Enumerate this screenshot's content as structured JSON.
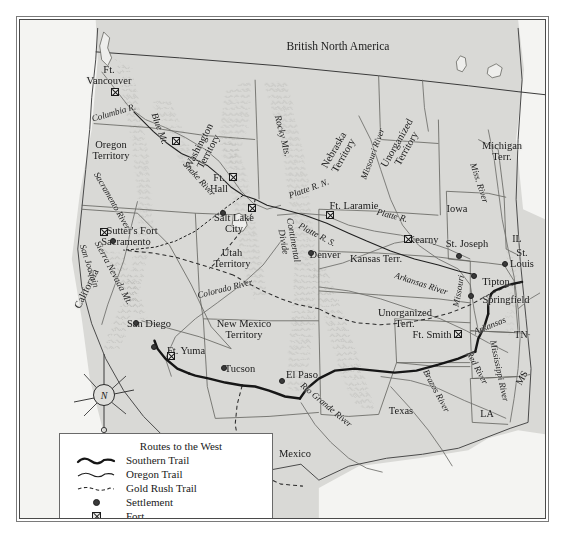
{
  "figure": {
    "kind": "historical-map",
    "frame_color": "#4a4a4a",
    "land_color": "#d9d9d6",
    "water_color": "#f2f2f0",
    "ink_color": "#1a1a1a"
  },
  "legend": {
    "title": "Routes to the West",
    "rows": [
      {
        "key": "thick-wavy-line",
        "label": "Southern Trail"
      },
      {
        "key": "thin-wavy-line",
        "label": "Oregon Trail"
      },
      {
        "key": "dashed-line",
        "label": "Gold Rush Trail"
      },
      {
        "key": "filled-dot",
        "label": "Settlement"
      },
      {
        "key": "crossed-square",
        "label": "Fort"
      }
    ]
  },
  "compass": {
    "north_letter": "N"
  },
  "labels": {
    "regions": [
      {
        "text": "British North America",
        "x": 337,
        "y": 46,
        "style": "t-big"
      },
      {
        "text": "Oregon\nTerritory",
        "x": 110,
        "y": 150,
        "style": "t-region"
      },
      {
        "text": "Washington\nTerritory",
        "x": 203,
        "y": 148,
        "style": "t-region",
        "rot": -62
      },
      {
        "text": "Utah\nTerritory",
        "x": 231,
        "y": 258,
        "style": "t-region"
      },
      {
        "text": "New Mexico\nTerritory",
        "x": 243,
        "y": 329,
        "style": "t-region"
      },
      {
        "text": "Nebraska\nTerritory",
        "x": 338,
        "y": 152,
        "style": "t-region",
        "rot": -60
      },
      {
        "text": "Unorganized\nTerritory",
        "x": 401,
        "y": 145,
        "style": "t-region",
        "rot": -60
      },
      {
        "text": "Kansas Terr.",
        "x": 375,
        "y": 258,
        "style": "t-region"
      },
      {
        "text": "Unorganized\nTerr.",
        "x": 404,
        "y": 318,
        "style": "t-region"
      },
      {
        "text": "Michigan\nTerr.",
        "x": 501,
        "y": 151,
        "style": "t-region"
      },
      {
        "text": "Iowa",
        "x": 456,
        "y": 208,
        "style": "t-region"
      },
      {
        "text": "Texas",
        "x": 400,
        "y": 410,
        "style": "t-region"
      },
      {
        "text": "California",
        "x": 86,
        "y": 288,
        "style": "t-region",
        "rot": -64
      },
      {
        "text": "Mexico",
        "x": 294,
        "y": 453,
        "style": "t-region"
      }
    ],
    "states": [
      {
        "text": "IL",
        "x": 516,
        "y": 238,
        "style": "t-state"
      },
      {
        "text": "TN",
        "x": 520,
        "y": 334,
        "style": "t-state"
      },
      {
        "text": "MS",
        "x": 521,
        "y": 377,
        "style": "t-state",
        "rot": -60
      },
      {
        "text": "LA",
        "x": 486,
        "y": 413,
        "style": "t-state"
      }
    ],
    "cities": [
      {
        "text": "Ft.\nVancouver",
        "x": 108,
        "y": 75,
        "style": "t-city"
      },
      {
        "text": "Ft.\nHall",
        "x": 218,
        "y": 183,
        "style": "t-city"
      },
      {
        "text": "Salt Lake\nCity",
        "x": 233,
        "y": 223,
        "style": "t-city"
      },
      {
        "text": "Sutter's Fort",
        "x": 131,
        "y": 230,
        "style": "t-city"
      },
      {
        "text": "Sacramento",
        "x": 125,
        "y": 241,
        "style": "t-city"
      },
      {
        "text": "Ft. Laramie",
        "x": 353,
        "y": 205,
        "style": "t-city"
      },
      {
        "text": "Denver",
        "x": 324,
        "y": 254,
        "style": "t-city"
      },
      {
        "text": "Kearny",
        "x": 422,
        "y": 239,
        "style": "t-city"
      },
      {
        "text": "St. Joseph",
        "x": 466,
        "y": 243,
        "style": "t-city"
      },
      {
        "text": "St.\nLouis",
        "x": 521,
        "y": 258,
        "style": "t-city"
      },
      {
        "text": "Tipton",
        "x": 495,
        "y": 281,
        "style": "t-city"
      },
      {
        "text": "Springfield",
        "x": 505,
        "y": 299,
        "style": "t-city"
      },
      {
        "text": "Ft. Smith",
        "x": 431,
        "y": 334,
        "style": "t-city"
      },
      {
        "text": "San Diego",
        "x": 148,
        "y": 323,
        "style": "t-city"
      },
      {
        "text": "Ft. Yuma",
        "x": 185,
        "y": 350,
        "style": "t-city"
      },
      {
        "text": "Tucson",
        "x": 239,
        "y": 368,
        "style": "t-city"
      },
      {
        "text": "El Paso",
        "x": 301,
        "y": 374,
        "style": "t-city"
      }
    ],
    "rivers": [
      {
        "text": "Columbia R.",
        "x": 113,
        "y": 112,
        "style": "t-river",
        "rot": -16
      },
      {
        "text": "Snake River",
        "x": 198,
        "y": 178,
        "style": "t-river",
        "rot": 48
      },
      {
        "text": "Sacramento River",
        "x": 111,
        "y": 200,
        "style": "t-river",
        "rot": 60
      },
      {
        "text": "San Joaquin",
        "x": 88,
        "y": 265,
        "style": "t-river",
        "rot": 72
      },
      {
        "text": "Colorado River",
        "x": 224,
        "y": 288,
        "style": "t-river",
        "rot": -14
      },
      {
        "text": "Platte R. N.",
        "x": 308,
        "y": 188,
        "style": "t-river",
        "rot": -20
      },
      {
        "text": "Platte R.",
        "x": 391,
        "y": 215,
        "style": "t-river",
        "rot": 14
      },
      {
        "text": "Platte R. S.",
        "x": 316,
        "y": 234,
        "style": "t-river",
        "rot": 28
      },
      {
        "text": "Missouri River",
        "x": 372,
        "y": 153,
        "style": "t-river",
        "rot": -70
      },
      {
        "text": "Arkansas River",
        "x": 420,
        "y": 283,
        "style": "t-river",
        "rot": 18
      },
      {
        "text": "Missouri",
        "x": 458,
        "y": 290,
        "style": "t-river",
        "rot": -80
      },
      {
        "text": "Miss. River",
        "x": 478,
        "y": 182,
        "style": "t-river",
        "rot": 72
      },
      {
        "text": "Mississippi River",
        "x": 498,
        "y": 370,
        "style": "t-river",
        "rot": 78
      },
      {
        "text": "Arkansas",
        "x": 489,
        "y": 325,
        "style": "t-river",
        "rot": -22
      },
      {
        "text": "Red River",
        "x": 476,
        "y": 367,
        "style": "t-river",
        "rot": 62
      },
      {
        "text": "Brazos River",
        "x": 435,
        "y": 390,
        "style": "t-river",
        "rot": 62
      },
      {
        "text": "Rio Grande River",
        "x": 325,
        "y": 404,
        "style": "t-river",
        "rot": 40
      }
    ],
    "mountains": [
      {
        "text": "Rocky Mts.",
        "x": 281,
        "y": 135,
        "style": "t-mtn",
        "rot": 76
      },
      {
        "text": "Blue Mt.",
        "x": 158,
        "y": 128,
        "style": "t-mtn",
        "rot": 70
      },
      {
        "text": "Sierra Nevada Mt.",
        "x": 112,
        "y": 272,
        "style": "t-mtn",
        "rot": 62
      },
      {
        "text": "Continental\nDivide",
        "x": 287,
        "y": 240,
        "style": "t-mtn",
        "rot": 80
      }
    ]
  },
  "symbols": {
    "settlements": [
      {
        "name": "sacramento",
        "x": 112,
        "y": 240
      },
      {
        "name": "san-diego",
        "x": 135,
        "y": 322
      },
      {
        "name": "unnamed-baja",
        "x": 153,
        "y": 346
      },
      {
        "name": "tucson",
        "x": 223,
        "y": 367
      },
      {
        "name": "el-paso",
        "x": 281,
        "y": 380
      },
      {
        "name": "salt-lake-city",
        "x": 222,
        "y": 212
      },
      {
        "name": "denver",
        "x": 310,
        "y": 252
      },
      {
        "name": "st-joseph",
        "x": 458,
        "y": 255
      },
      {
        "name": "st-louis",
        "x": 504,
        "y": 263
      },
      {
        "name": "tipton",
        "x": 473,
        "y": 275
      },
      {
        "name": "springfield",
        "x": 470,
        "y": 295
      }
    ],
    "forts": [
      {
        "name": "ft-vancouver",
        "x": 114,
        "y": 91
      },
      {
        "name": "ft-walla",
        "x": 175,
        "y": 140
      },
      {
        "name": "ft-hall",
        "x": 232,
        "y": 176
      },
      {
        "name": "ft-bridger",
        "x": 251,
        "y": 207
      },
      {
        "name": "sutters-fort",
        "x": 103,
        "y": 231
      },
      {
        "name": "ft-laramie",
        "x": 329,
        "y": 214
      },
      {
        "name": "ft-kearny",
        "x": 407,
        "y": 238
      },
      {
        "name": "ft-smith",
        "x": 457,
        "y": 333
      },
      {
        "name": "ft-yuma",
        "x": 170,
        "y": 355
      }
    ]
  }
}
